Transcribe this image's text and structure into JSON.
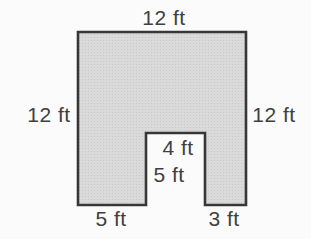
{
  "figure": {
    "shape": "composite-rectilinear",
    "unit": "ft",
    "labels": {
      "top_width": "12 ft",
      "left_height": "12 ft",
      "right_height": "12 ft",
      "notch_width": "4 ft",
      "notch_depth": "5 ft",
      "bottom_left_segment": "5 ft",
      "bottom_right_segment": "3 ft"
    },
    "dimensions_ft": {
      "top_width": 12,
      "left_height": 12,
      "right_height": 12,
      "notch_width": 4,
      "notch_depth": 5,
      "bottom_left_segment": 5,
      "bottom_right_segment": 3
    },
    "colors": {
      "shape_fill": "#dadada",
      "shape_texture_dot": "#c6c6c6",
      "shape_stroke": "#373737",
      "label_text": "#3f3f3f",
      "background": "#fbfbfb"
    }
  }
}
